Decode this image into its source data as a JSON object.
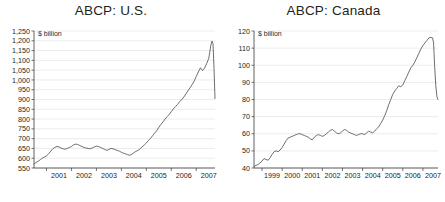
{
  "figure": {
    "background": "#ffffff",
    "series_color": "#5d5d5d",
    "grid_color": "#d9d9d9",
    "axis_color": "#3a3a3a"
  },
  "panels": {
    "us": {
      "title": "ABCP: U.S.",
      "units": "$ billion"
    },
    "canada": {
      "title": "ABCP: Canada",
      "units": "$ billion"
    }
  },
  "chart_data": [
    {
      "type": "line",
      "title": "ABCP: U.S.",
      "xlabel": "",
      "ylabel": "$ billion",
      "ylim": [
        550,
        1250
      ],
      "ytick_labels": [
        "1,250",
        "1,200",
        "1,150",
        "1,100",
        "1,050",
        "1,000",
        "950",
        "900",
        "850",
        "800",
        "750",
        "700",
        "650",
        "600",
        "550"
      ],
      "yticks": [
        1250,
        1200,
        1150,
        1100,
        1050,
        1000,
        950,
        900,
        850,
        800,
        750,
        700,
        650,
        600,
        550
      ],
      "xlim": [
        2000.5,
        2007.75
      ],
      "xtick_labels": [
        "2001",
        "2002",
        "2003",
        "2004",
        "2005",
        "2006",
        "2007"
      ],
      "xticks": [
        2001,
        2002,
        2003,
        2004,
        2005,
        2006,
        2007
      ],
      "grid": true,
      "legend": false,
      "series": [
        {
          "name": "ABCP outstanding, U.S.",
          "x": [
            2000.5,
            2000.58,
            2000.67,
            2000.75,
            2000.83,
            2000.92,
            2001.0,
            2001.08,
            2001.17,
            2001.25,
            2001.33,
            2001.42,
            2001.5,
            2001.58,
            2001.67,
            2001.75,
            2001.83,
            2001.92,
            2002.0,
            2002.08,
            2002.17,
            2002.25,
            2002.33,
            2002.42,
            2002.5,
            2002.58,
            2002.67,
            2002.75,
            2002.83,
            2002.92,
            2003.0,
            2003.08,
            2003.17,
            2003.25,
            2003.33,
            2003.42,
            2003.5,
            2003.58,
            2003.67,
            2003.75,
            2003.83,
            2003.92,
            2004.0,
            2004.08,
            2004.17,
            2004.25,
            2004.33,
            2004.42,
            2004.5,
            2004.58,
            2004.67,
            2004.75,
            2004.83,
            2004.92,
            2005.0,
            2005.08,
            2005.17,
            2005.25,
            2005.33,
            2005.42,
            2005.5,
            2005.58,
            2005.67,
            2005.75,
            2005.83,
            2005.92,
            2006.0,
            2006.08,
            2006.17,
            2006.25,
            2006.33,
            2006.42,
            2006.5,
            2006.58,
            2006.67,
            2006.75,
            2006.83,
            2006.92,
            2007.0,
            2007.08,
            2007.17,
            2007.25,
            2007.33,
            2007.42,
            2007.5,
            2007.54,
            2007.58,
            2007.63,
            2007.67,
            2007.71,
            2007.75
          ],
          "y": [
            570,
            578,
            585,
            592,
            600,
            606,
            612,
            622,
            636,
            648,
            655,
            660,
            658,
            652,
            648,
            646,
            650,
            655,
            660,
            668,
            672,
            670,
            665,
            660,
            655,
            652,
            650,
            648,
            652,
            658,
            662,
            660,
            655,
            650,
            645,
            640,
            645,
            650,
            648,
            644,
            640,
            636,
            630,
            626,
            622,
            618,
            615,
            620,
            628,
            635,
            640,
            648,
            658,
            668,
            678,
            690,
            702,
            715,
            728,
            742,
            758,
            772,
            786,
            800,
            812,
            824,
            838,
            852,
            864,
            875,
            888,
            900,
            912,
            928,
            945,
            960,
            975,
            995,
            1018,
            1040,
            1062,
            1048,
            1060,
            1085,
            1110,
            1140,
            1175,
            1198,
            1185,
            1060,
            905
          ]
        }
      ]
    },
    {
      "type": "line",
      "title": "ABCP: Canada",
      "xlabel": "",
      "ylabel": "$ billion",
      "ylim": [
        40,
        120
      ],
      "ytick_labels": [
        "120",
        "110",
        "100",
        "90",
        "80",
        "70",
        "60",
        "50",
        "40"
      ],
      "yticks": [
        120,
        110,
        100,
        90,
        80,
        70,
        60,
        50,
        40
      ],
      "xlim": [
        1998.6,
        2007.75
      ],
      "xtick_labels": [
        "1999",
        "2000",
        "2001",
        "2002",
        "2003",
        "2004",
        "2005",
        "2006",
        "2007"
      ],
      "xticks": [
        1999,
        2000,
        2001,
        2002,
        2003,
        2004,
        2005,
        2006,
        2007
      ],
      "grid": true,
      "legend": false,
      "series": [
        {
          "name": "ABCP outstanding, Canada",
          "x": [
            1998.6,
            1998.7,
            1998.8,
            1998.9,
            1999.0,
            1999.1,
            1999.2,
            1999.3,
            1999.4,
            1999.5,
            1999.6,
            1999.7,
            1999.8,
            1999.9,
            2000.0,
            2000.1,
            2000.2,
            2000.3,
            2000.4,
            2000.5,
            2000.6,
            2000.7,
            2000.8,
            2000.9,
            2001.0,
            2001.1,
            2001.2,
            2001.3,
            2001.4,
            2001.5,
            2001.6,
            2001.7,
            2001.8,
            2001.9,
            2002.0,
            2002.1,
            2002.2,
            2002.3,
            2002.4,
            2002.5,
            2002.6,
            2002.7,
            2002.8,
            2002.9,
            2003.0,
            2003.1,
            2003.2,
            2003.3,
            2003.4,
            2003.5,
            2003.6,
            2003.7,
            2003.8,
            2003.9,
            2004.0,
            2004.1,
            2004.2,
            2004.3,
            2004.4,
            2004.5,
            2004.6,
            2004.7,
            2004.8,
            2004.9,
            2005.0,
            2005.1,
            2005.2,
            2005.3,
            2005.4,
            2005.5,
            2005.6,
            2005.7,
            2005.8,
            2005.9,
            2006.0,
            2006.1,
            2006.2,
            2006.3,
            2006.4,
            2006.5,
            2006.6,
            2006.7,
            2006.8,
            2006.9,
            2007.0,
            2007.1,
            2007.2,
            2007.3,
            2007.4,
            2007.48,
            2007.53,
            2007.58,
            2007.64,
            2007.7,
            2007.75
          ],
          "y": [
            41.0,
            41.5,
            42.0,
            43.0,
            44.0,
            45.5,
            45.0,
            44.5,
            46.0,
            48.0,
            49.5,
            50.0,
            49.5,
            50.5,
            52.0,
            54.0,
            56.0,
            57.5,
            58.0,
            58.5,
            59.0,
            59.5,
            60.0,
            60.0,
            59.5,
            59.0,
            58.5,
            58.0,
            57.0,
            56.5,
            58.0,
            59.0,
            59.5,
            59.0,
            58.5,
            59.0,
            60.0,
            61.0,
            62.0,
            62.5,
            61.5,
            60.5,
            60.0,
            60.5,
            61.5,
            62.5,
            62.0,
            61.0,
            60.5,
            60.0,
            59.5,
            59.0,
            59.5,
            60.0,
            60.0,
            59.5,
            60.5,
            61.5,
            61.0,
            60.5,
            61.5,
            63.0,
            64.0,
            66.0,
            68.0,
            70.5,
            73.5,
            77.0,
            80.0,
            83.0,
            85.0,
            86.5,
            88.0,
            87.5,
            88.5,
            91.0,
            93.5,
            96.0,
            98.5,
            100.0,
            102.0,
            104.5,
            107.0,
            109.5,
            111.5,
            113.0,
            114.5,
            116.0,
            116.2,
            116.0,
            113.0,
            100.0,
            88.0,
            81.5,
            80.0
          ]
        }
      ]
    }
  ]
}
